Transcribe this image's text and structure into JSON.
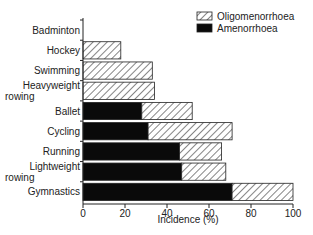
{
  "chart_data": {
    "type": "bar",
    "orientation": "horizontal",
    "stacked": true,
    "title": "",
    "xlabel": "Incidence (%)",
    "ylabel": "",
    "xlim": [
      0,
      100
    ],
    "xticks": [
      0,
      20,
      40,
      60,
      80,
      100
    ],
    "grid": false,
    "legend_position": "top-right",
    "categories": [
      "Badminton",
      "Hockey",
      "Swimming",
      "Heavyweight rowing",
      "Ballet",
      "Cycling",
      "Running",
      "Lightweight rowing",
      "Gymnastics"
    ],
    "category_lines": [
      [
        "Badminton"
      ],
      [
        "Hockey"
      ],
      [
        "Swimming"
      ],
      [
        "Heavyweight",
        "rowing"
      ],
      [
        "Ballet"
      ],
      [
        "Cycling"
      ],
      [
        "Running"
      ],
      [
        "Lightweight",
        "rowing"
      ],
      [
        "Gymnastics"
      ]
    ],
    "series": [
      {
        "name": "Amenorrhoea",
        "fill": "solid-black",
        "values": [
          0,
          0,
          0,
          0,
          28,
          31,
          46,
          47,
          71
        ]
      },
      {
        "name": "Oligomenorrhoea",
        "fill": "diagonal-hatch",
        "values": [
          0,
          18,
          33,
          34,
          24,
          40,
          20,
          21,
          29
        ]
      }
    ],
    "totals": [
      0,
      18,
      33,
      34,
      52,
      71,
      66,
      68,
      100
    ],
    "legend": [
      "Oligomenorrhoea",
      "Amenorrhoea"
    ]
  },
  "colors": {
    "solid": "#0a0a0a",
    "hatch_stroke": "#333333",
    "axis": "#222222"
  }
}
